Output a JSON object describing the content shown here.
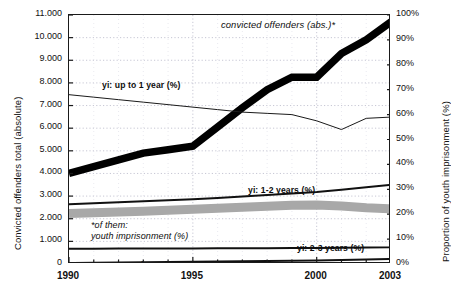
{
  "chart_data": {
    "type": "line",
    "title": "",
    "xlabel": "",
    "ylabel": "Convicted offenders total (absolute)",
    "y2label": "Proportion of youth imprisonment (%)",
    "grid": true,
    "legend_position": "inline-labels",
    "x": [
      1990,
      1991,
      1992,
      1993,
      1994,
      1995,
      1996,
      1997,
      1998,
      1999,
      2000,
      2001,
      2002,
      2003
    ],
    "xlim": [
      1990,
      2003
    ],
    "xticks_major": [
      "1990",
      "1995",
      "2000",
      "2003"
    ],
    "xticks_all": [
      1990,
      1991,
      1992,
      1993,
      1994,
      1995,
      1996,
      1997,
      1998,
      1999,
      2000,
      2001,
      2002,
      2003
    ],
    "ylim": [
      0,
      11000
    ],
    "yticks": [
      "11.000",
      "10.000",
      "9.000",
      "8.000",
      "7.000",
      "6.000",
      "5.000",
      "4.000",
      "3.000",
      "2.000",
      "1.000",
      "0"
    ],
    "y2lim": [
      0,
      100
    ],
    "y2ticks": [
      "100%",
      "90%",
      "80%",
      "70%",
      "60%",
      "50%",
      "40%",
      "30%",
      "20%",
      "10%",
      "0%"
    ],
    "series": [
      {
        "name": "convicted offenders (abs.)*",
        "label": "convicted offenders (abs.)*",
        "axis": "left",
        "style": "thick-black",
        "color": "#000000",
        "values": [
          4000,
          4300,
          4600,
          4900,
          5050,
          5200,
          6050,
          6900,
          7700,
          8250,
          8250,
          9300,
          9900,
          10700
        ]
      },
      {
        "name": "yi: up to 1 year (%)",
        "label": "yi: up to 1 year (%)",
        "axis": "right",
        "style": "thin-black",
        "color": "#1a1a1a",
        "values": [
          68.0,
          67.0,
          66.0,
          65.0,
          64.0,
          63.0,
          62.0,
          61.0,
          60.5,
          60.0,
          57.5,
          54.0,
          58.5,
          59.0
        ]
      },
      {
        "name": "yi: 1-2 years (%)",
        "label": "yi: 1-2 years (%)",
        "axis": "right",
        "style": "medium-black",
        "color": "#111111",
        "values": [
          24.0,
          24.4,
          24.8,
          25.2,
          25.6,
          26.0,
          26.5,
          27.1,
          27.7,
          28.3,
          28.9,
          29.8,
          30.8,
          31.8
        ]
      },
      {
        "name": "*of them: youth imprisonment (%)",
        "label": "*of them: youth imprisonment (%)",
        "axis": "right",
        "style": "grey-band",
        "color": "#a8a8a8",
        "values": [
          20.3,
          20.6,
          20.9,
          21.2,
          21.6,
          22.0,
          22.4,
          22.8,
          23.2,
          23.6,
          23.7,
          23.3,
          22.6,
          22.2
        ]
      },
      {
        "name": "yi: 2-3 years (%)",
        "label": "yi: 2-3 years (%)",
        "axis": "right",
        "style": "medium-black",
        "color": "#111111",
        "values": [
          6.1,
          6.1,
          6.2,
          6.2,
          6.2,
          6.2,
          6.3,
          6.3,
          6.3,
          6.4,
          6.4,
          6.5,
          6.6,
          6.7
        ]
      },
      {
        "name": "yi: 3-10 years (%)",
        "label": "yi: 3-10 years (%)",
        "axis": "right",
        "style": "medium-black",
        "color": "#111111",
        "values": [
          0.4,
          0.5,
          0.6,
          0.7,
          0.8,
          0.9,
          1.0,
          1.1,
          1.2,
          1.3,
          1.4,
          1.6,
          1.8,
          2.0
        ]
      }
    ],
    "annotations": [
      {
        "text": "*of them:",
        "line2": "youth imprisonment (%)"
      }
    ]
  },
  "axes": {
    "left_title": "Convicted offenders total (absolute)",
    "right_title": "Proportion of youth imprisonment (%)",
    "left_ticks": [
      "11.000",
      "10.000",
      "9.000",
      "8.000",
      "7.000",
      "6.000",
      "5.000",
      "4.000",
      "3.000",
      "2.000",
      "1.000",
      "0"
    ],
    "right_ticks": [
      "100%",
      "90%",
      "80%",
      "70%",
      "60%",
      "50%",
      "40%",
      "30%",
      "20%",
      "10%",
      "0%"
    ],
    "x_ticks": [
      "1990",
      "1995",
      "2000",
      "2003"
    ]
  },
  "labels": {
    "convicted": "convicted offenders (abs.)*",
    "upto1": "yi: up to 1 year (%)",
    "y1_2": "yi: 1-2 years (%)",
    "y2_3": "yi: 2-3 years (%)",
    "y3_10": "yi: 3-10 years (%)",
    "note_line1": "*of them:",
    "note_line2": "youth imprisonment (%)"
  }
}
